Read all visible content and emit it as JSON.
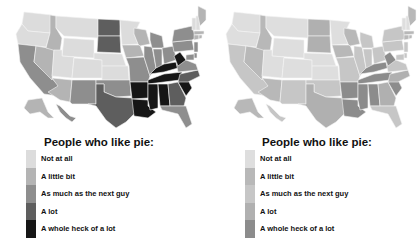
{
  "maps": [
    {
      "id": "left",
      "legend_title": "People who like pie:",
      "legend": [
        {
          "label": "Not at all",
          "color": "#dcdcdc"
        },
        {
          "label": "A little bit",
          "color": "#b4b4b4"
        },
        {
          "label": "As much as the next guy",
          "color": "#8e8e8e"
        },
        {
          "label": "A lot",
          "color": "#5e5e5e"
        },
        {
          "label": "A whole heck of a lot",
          "color": "#161616"
        }
      ],
      "states": {
        "WA": 0,
        "OR": 0,
        "CA": 2,
        "NV": 1,
        "ID": 1,
        "MT": 0,
        "WY": 0,
        "UT": 0,
        "AZ": 1,
        "CO": 0,
        "NM": 2,
        "ND": 3,
        "SD": 3,
        "NE": 0,
        "KS": 0,
        "OK": 2,
        "TX": 3,
        "MN": 0,
        "IA": 1,
        "MO": 2,
        "AR": 4,
        "LA": 4,
        "WI": 1,
        "IL": 2,
        "MI": 2,
        "IN": 2,
        "OH": 2,
        "KY": 4,
        "TN": 4,
        "MS": 4,
        "AL": 4,
        "GA": 3,
        "FL": 2,
        "SC": 4,
        "NC": 3,
        "VA": 2,
        "WV": 4,
        "PA": 2,
        "NY": 2,
        "VT": 0,
        "NH": 0,
        "ME": 1,
        "MA": 1,
        "CT": 1,
        "RI": 1,
        "NJ": 2,
        "DE": 2,
        "MD": 2,
        "AK": 1,
        "HI": 2
      }
    },
    {
      "id": "right",
      "legend_title": "People who like pie:",
      "legend": [
        {
          "label": "Not at all",
          "color": "#dedede"
        },
        {
          "label": "A little bit",
          "color": "#b8b8b8"
        },
        {
          "label": "As much as the next guy",
          "color": "#c6c6c6"
        },
        {
          "label": "A lot",
          "color": "#b0b0b0"
        },
        {
          "label": "A whole heck of a lot",
          "color": "#8c8c8c"
        }
      ],
      "states": {
        "WA": 0,
        "OR": 0,
        "CA": 2,
        "NV": 1,
        "ID": 1,
        "MT": 0,
        "WY": 0,
        "UT": 0,
        "AZ": 1,
        "CO": 0,
        "NM": 2,
        "ND": 3,
        "SD": 3,
        "NE": 0,
        "KS": 0,
        "OK": 2,
        "TX": 3,
        "MN": 0,
        "IA": 1,
        "MO": 2,
        "AR": 4,
        "LA": 4,
        "WI": 1,
        "IL": 2,
        "MI": 2,
        "IN": 2,
        "OH": 2,
        "KY": 4,
        "TN": 4,
        "MS": 4,
        "AL": 4,
        "GA": 3,
        "FL": 2,
        "SC": 4,
        "NC": 3,
        "VA": 2,
        "WV": 4,
        "PA": 2,
        "NY": 2,
        "VT": 0,
        "NH": 0,
        "ME": 1,
        "MA": 1,
        "CT": 1,
        "RI": 1,
        "NJ": 2,
        "DE": 2,
        "MD": 2,
        "AK": 1,
        "HI": 2
      }
    }
  ]
}
